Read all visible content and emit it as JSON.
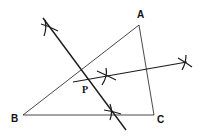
{
  "diagram": {
    "vertices": {
      "A": {
        "label": "A",
        "x": 139,
        "y": 25
      },
      "B": {
        "label": "B",
        "x": 23,
        "y": 115
      },
      "C": {
        "label": "C",
        "x": 154,
        "y": 115
      }
    },
    "labels": {
      "A": "A",
      "B": "B",
      "C": "C",
      "P": "P"
    },
    "construction_lines": [
      {
        "name": "bisector-1",
        "x1": 43,
        "y1": 18,
        "x2": 126,
        "y2": 130
      },
      {
        "name": "bisector-2",
        "x1": 73,
        "y1": 82,
        "x2": 187,
        "y2": 62
      }
    ],
    "arc_marks": [
      {
        "name": "arc-mark-top-left",
        "x": 49,
        "y": 27
      },
      {
        "name": "arc-mark-bottom",
        "x": 112,
        "y": 112
      },
      {
        "name": "arc-mark-middle",
        "x": 107,
        "y": 76
      },
      {
        "name": "arc-mark-right",
        "x": 185,
        "y": 63
      }
    ],
    "colors": {
      "stroke": "#1a1a1a",
      "background": "#ffffff"
    }
  }
}
